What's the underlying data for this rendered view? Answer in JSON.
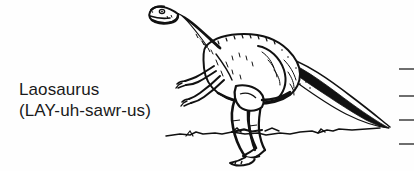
{
  "page": {
    "background_color": "#fefefe",
    "width": 414,
    "height": 171
  },
  "label": {
    "common_name": "Laosaurus",
    "pronunciation": "(LAY-uh-sawr-us)",
    "text_color": "#1a1a1a"
  },
  "illustration": {
    "subject": "dinosaur-laosaurus",
    "description": "line drawing of a bipedal ornithopod dinosaur facing left, standing on a ground line",
    "ink_color": "#111111",
    "fill_color": "#ffffff",
    "parts": [
      "head",
      "eye",
      "mouth",
      "neck",
      "body",
      "foreleg-left",
      "foreleg-right",
      "hindleg-front",
      "hindleg-back",
      "foot-front",
      "foot-back",
      "tail",
      "ground-line"
    ]
  },
  "margin_rules": {
    "count": 4,
    "color": "#6e6e6e",
    "positions_y": [
      68,
      95,
      119,
      143
    ]
  }
}
